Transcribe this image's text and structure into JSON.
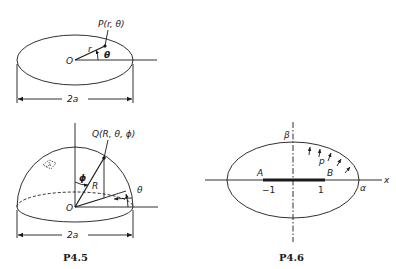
{
  "figure_p45_top": {
    "point_label": "P(r, θ)",
    "origin_label": "O",
    "radius_label": "r",
    "angle_label": "θ",
    "dimension_label": "2a"
  },
  "figure_p45_bottom": {
    "point_label": "Q(R, θ, ϕ)",
    "origin_label": "O",
    "radius_label": "R",
    "polar_angle_label": "ϕ",
    "azimuth_label": "θ",
    "dimension_label": "2a",
    "caption": "P4.5"
  },
  "figure_p46": {
    "beta_label": "β",
    "alpha_label": "α",
    "x_axis_label": "x",
    "pressure_label": "p",
    "point_a_label": "A",
    "point_b_label": "B",
    "tick_neg_label": "−1",
    "tick_pos_label": "1",
    "caption": "P4.6"
  }
}
